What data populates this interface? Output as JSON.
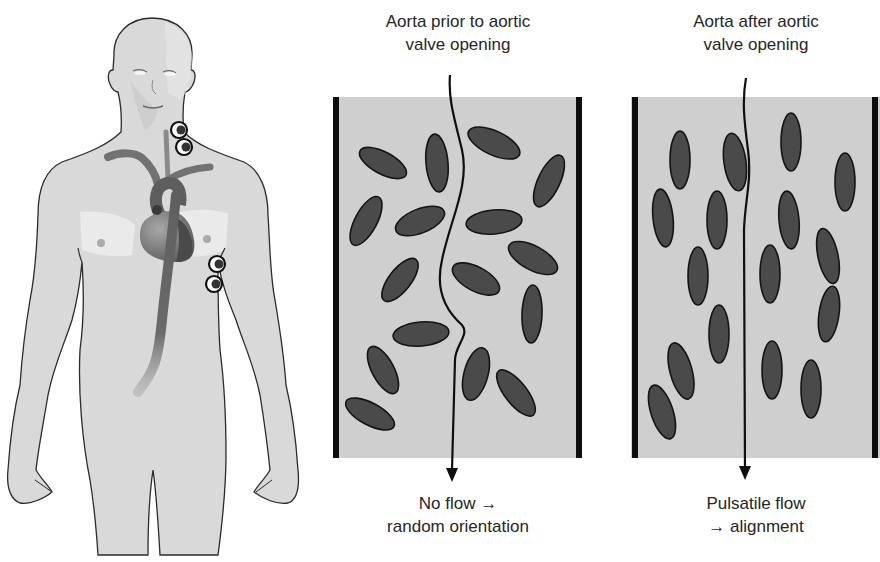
{
  "figure": {
    "person": {
      "label": "Patient with electrodes on neck and chest, aorta and heart shown"
    },
    "panels": [
      {
        "id": "before",
        "title_line1": "Aorta prior to aortic",
        "title_line2": "valve opening",
        "caption_line1": "No flow →",
        "caption_line2": "random orientation",
        "state": "random",
        "ellipses": [
          {
            "cx": 383,
            "cy": 163,
            "rx": 26,
            "ry": 11,
            "rot": 28
          },
          {
            "cx": 437,
            "cy": 163,
            "rx": 11,
            "ry": 29,
            "rot": -5
          },
          {
            "cx": 494,
            "cy": 143,
            "rx": 28,
            "ry": 12,
            "rot": 25
          },
          {
            "cx": 549,
            "cy": 181,
            "rx": 11,
            "ry": 28,
            "rot": 25
          },
          {
            "cx": 366,
            "cy": 221,
            "rx": 11,
            "ry": 27,
            "rot": 28
          },
          {
            "cx": 420,
            "cy": 221,
            "rx": 26,
            "ry": 12,
            "rot": -22
          },
          {
            "cx": 494,
            "cy": 222,
            "rx": 28,
            "ry": 12,
            "rot": -5
          },
          {
            "cx": 533,
            "cy": 258,
            "rx": 27,
            "ry": 12,
            "rot": 28
          },
          {
            "cx": 400,
            "cy": 280,
            "rx": 11,
            "ry": 26,
            "rot": 38
          },
          {
            "cx": 476,
            "cy": 279,
            "rx": 26,
            "ry": 12,
            "rot": 28
          },
          {
            "cx": 532,
            "cy": 314,
            "rx": 10,
            "ry": 29,
            "rot": 2
          },
          {
            "cx": 421,
            "cy": 334,
            "rx": 28,
            "ry": 12,
            "rot": -5
          },
          {
            "cx": 383,
            "cy": 370,
            "rx": 11,
            "ry": 26,
            "rot": -28
          },
          {
            "cx": 476,
            "cy": 374,
            "rx": 12,
            "ry": 27,
            "rot": 15
          },
          {
            "cx": 516,
            "cy": 393,
            "rx": 11,
            "ry": 28,
            "rot": -38
          },
          {
            "cx": 370,
            "cy": 414,
            "rx": 27,
            "ry": 11,
            "rot": 28
          }
        ]
      },
      {
        "id": "after",
        "title_line1": "Aorta after aortic",
        "title_line2": "valve opening",
        "caption_line1": "Pulsatile flow",
        "caption_line2": "→ alignment",
        "state": "aligned",
        "ellipses": [
          {
            "cx": 680,
            "cy": 160,
            "rx": 10,
            "ry": 29,
            "rot": 0
          },
          {
            "cx": 735,
            "cy": 162,
            "rx": 11,
            "ry": 29,
            "rot": -8
          },
          {
            "cx": 791,
            "cy": 142,
            "rx": 10,
            "ry": 29,
            "rot": 0
          },
          {
            "cx": 845,
            "cy": 182,
            "rx": 10,
            "ry": 29,
            "rot": 0
          },
          {
            "cx": 663,
            "cy": 218,
            "rx": 10,
            "ry": 29,
            "rot": -6
          },
          {
            "cx": 717,
            "cy": 220,
            "rx": 10,
            "ry": 29,
            "rot": 0
          },
          {
            "cx": 789,
            "cy": 220,
            "rx": 10,
            "ry": 29,
            "rot": -5
          },
          {
            "cx": 828,
            "cy": 256,
            "rx": 10,
            "ry": 28,
            "rot": -12
          },
          {
            "cx": 698,
            "cy": 276,
            "rx": 10,
            "ry": 29,
            "rot": 0
          },
          {
            "cx": 770,
            "cy": 274,
            "rx": 10,
            "ry": 29,
            "rot": 0
          },
          {
            "cx": 829,
            "cy": 314,
            "rx": 10,
            "ry": 28,
            "rot": 8
          },
          {
            "cx": 719,
            "cy": 334,
            "rx": 10,
            "ry": 29,
            "rot": 0
          },
          {
            "cx": 681,
            "cy": 371,
            "rx": 11,
            "ry": 29,
            "rot": -15
          },
          {
            "cx": 772,
            "cy": 370,
            "rx": 10,
            "ry": 29,
            "rot": 0
          },
          {
            "cx": 811,
            "cy": 389,
            "rx": 10,
            "ry": 29,
            "rot": 0
          },
          {
            "cx": 662,
            "cy": 412,
            "rx": 11,
            "ry": 28,
            "rot": -18
          }
        ]
      }
    ],
    "colors": {
      "panel_fill": "#cfcfcf",
      "panel_wall": "#0d0d0d",
      "cell_fill": "#4a4a4a",
      "cell_stroke": "#141414",
      "skin": "#d9d9d9",
      "skin_outline": "#2b2b2b",
      "aorta": "#6b6b6b",
      "heart": "#7d7d7d",
      "lung": "#ececec"
    }
  }
}
